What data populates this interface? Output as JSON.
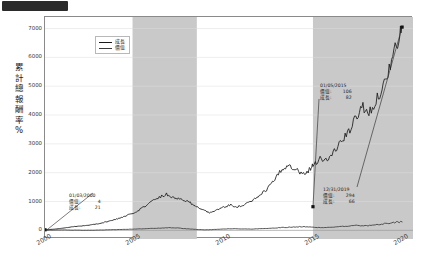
{
  "figure": {
    "ylabel": "累計總報酬率%",
    "ylabel_chars": [
      "累",
      "計",
      "總",
      "報",
      "酬",
      "率",
      "%"
    ]
  },
  "legend": {
    "position": "upper-left",
    "items": [
      {
        "label": "成長",
        "color": "#1a1a1a"
      },
      {
        "label": "價值",
        "color": "#3a3a3a"
      }
    ]
  },
  "annotations": [
    {
      "name": "annotation-2000",
      "date": "01/03/2000",
      "rows": [
        {
          "key": "價值:",
          "value": "4"
        },
        {
          "key": "成長:",
          "value": "21"
        }
      ]
    },
    {
      "name": "annotation-2015",
      "date": "01/05/2015",
      "rows": [
        {
          "key": "價值:",
          "value": "106"
        },
        {
          "key": "成長:",
          "value": "82"
        }
      ]
    },
    {
      "name": "annotation-2019",
      "date": "12/31/2019",
      "rows": [
        {
          "key": "價值:",
          "value": "294"
        },
        {
          "key": "成長:",
          "value": "66"
        }
      ]
    }
  ],
  "chart_data": {
    "type": "line",
    "title": "",
    "xlabel": "",
    "ylabel": "累計總報酬率%",
    "xlim": [
      2000.0,
      2020.6
    ],
    "ylim": [
      -300,
      7400
    ],
    "grid": true,
    "xticks": [
      2000,
      2005,
      2010,
      2015,
      2020
    ],
    "xticklabels": [
      "2000",
      "2005",
      "2010",
      "2015",
      "2020"
    ],
    "yticks": [
      0,
      1000,
      2000,
      3000,
      4000,
      5000,
      6000,
      7000
    ],
    "yticklabels": [
      "0",
      "1000",
      "2000",
      "3000",
      "4000",
      "5000",
      "6000",
      "7000"
    ],
    "shaded_bands": [
      {
        "x0": 2004.9,
        "x1": 2008.5,
        "color": "#c9c9c9"
      },
      {
        "x0": 2015.0,
        "x1": 2020.6,
        "color": "#c9c9c9"
      }
    ],
    "markers": [
      {
        "x": 2000.0,
        "y": 20,
        "series": "成長"
      },
      {
        "x": 2015.0,
        "y": 820,
        "series": "成長"
      },
      {
        "x": 2019.99,
        "y": 7050,
        "series": "成長"
      }
    ],
    "series": [
      {
        "name": "成長",
        "color": "#1a1a1a",
        "x": [
          2000.0,
          2000.4,
          2000.8,
          2001.2,
          2001.6,
          2002.0,
          2002.4,
          2002.8,
          2003.2,
          2003.6,
          2004.0,
          2004.4,
          2004.8,
          2005.2,
          2005.6,
          2006.0,
          2006.4,
          2006.8,
          2007.2,
          2007.6,
          2008.0,
          2008.4,
          2008.8,
          2009.2,
          2009.6,
          2010.0,
          2010.4,
          2010.8,
          2011.2,
          2011.6,
          2012.0,
          2012.4,
          2012.8,
          2013.2,
          2013.6,
          2014.0,
          2014.4,
          2014.8,
          2015.0,
          2015.4,
          2015.8,
          2016.2,
          2016.6,
          2017.0,
          2017.4,
          2017.8,
          2018.2,
          2018.6,
          2019.0,
          2019.4,
          2019.8,
          2019.99
        ],
        "y": [
          20,
          35,
          60,
          95,
          130,
          150,
          175,
          210,
          260,
          320,
          390,
          470,
          560,
          690,
          840,
          1010,
          1160,
          1250,
          1150,
          1080,
          1000,
          870,
          700,
          620,
          700,
          800,
          880,
          820,
          900,
          1020,
          1180,
          1420,
          1700,
          2050,
          2300,
          2150,
          1950,
          2100,
          2280,
          2500,
          2420,
          2750,
          3100,
          3400,
          3900,
          4300,
          4100,
          4600,
          5100,
          5900,
          6600,
          7050
        ]
      },
      {
        "name": "價值",
        "color": "#3a3a3a",
        "x": [
          2000.0,
          2000.5,
          2001.0,
          2001.5,
          2002.0,
          2002.5,
          2003.0,
          2003.5,
          2004.0,
          2004.5,
          2005.0,
          2005.5,
          2006.0,
          2006.5,
          2007.0,
          2007.5,
          2008.0,
          2008.5,
          2009.0,
          2009.5,
          2010.0,
          2010.5,
          2011.0,
          2011.5,
          2012.0,
          2012.5,
          2013.0,
          2013.5,
          2014.0,
          2014.5,
          2015.0,
          2015.5,
          2016.0,
          2016.5,
          2017.0,
          2017.5,
          2018.0,
          2018.5,
          2019.0,
          2019.5,
          2019.99
        ],
        "y": [
          4,
          10,
          14,
          8,
          5,
          2,
          8,
          18,
          26,
          34,
          42,
          55,
          68,
          80,
          92,
          78,
          52,
          30,
          18,
          30,
          46,
          58,
          50,
          44,
          56,
          70,
          88,
          104,
          118,
          130,
          106,
          96,
          112,
          128,
          150,
          172,
          158,
          188,
          226,
          268,
          294
        ]
      }
    ]
  }
}
